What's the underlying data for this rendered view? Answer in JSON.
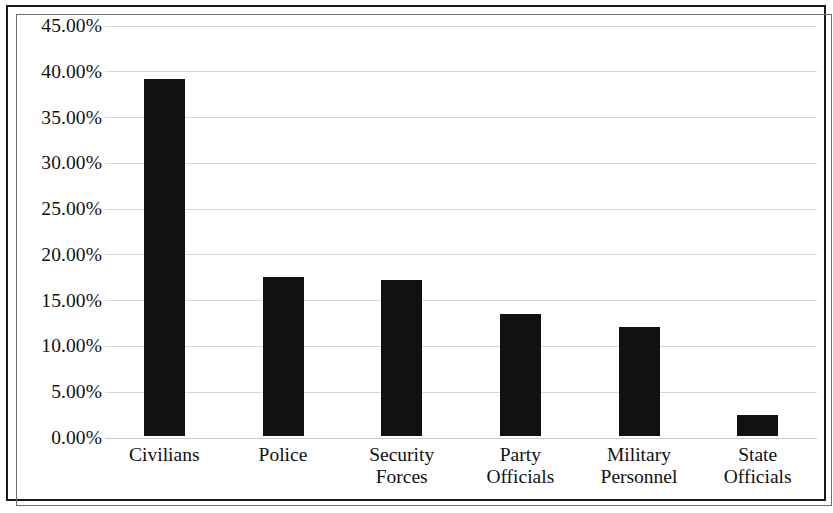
{
  "chart_data": {
    "type": "bar",
    "title": "",
    "subtitle": "",
    "xlabel": "",
    "ylabel": "",
    "categories": [
      "Civilians",
      "Security Forces",
      "Police",
      "Party Officials",
      "Military Personnel",
      "State Officials"
    ],
    "category_lines": [
      [
        "Civilians",
        ""
      ],
      [
        "Police",
        ""
      ],
      [
        "Security",
        "Forces"
      ],
      [
        "Party",
        "Officials"
      ],
      [
        "Military",
        "Personnel"
      ],
      [
        "State",
        "Officials"
      ]
    ],
    "categories_ordered": [
      "Civilians",
      "Police",
      "Security Forces",
      "Party Officials",
      "Military Personnel",
      "State Officials"
    ],
    "values": [
      39.0,
      17.4,
      17.0,
      13.3,
      11.9,
      2.3
    ],
    "value_labels": [
      "39.00%",
      "17.40%",
      "17.00%",
      "13.30%",
      "11.90%",
      "2.30%"
    ],
    "ylim": [
      0,
      45
    ],
    "ytick_values": [
      0,
      5,
      10,
      15,
      20,
      25,
      30,
      35,
      40,
      45
    ],
    "ytick_labels": [
      "0.00%",
      "5.00%",
      "10.00%",
      "15.00%",
      "20.00%",
      "25.00%",
      "30.00%",
      "35.00%",
      "40.00%",
      "45.00%"
    ],
    "grid": true,
    "grid_axis": "y",
    "legend": false,
    "legend_position": "none",
    "bar_color": "#111111",
    "grid_color": "#d8d8d8",
    "frame_color": "#1a1a1a",
    "background_color": "#ffffff"
  }
}
